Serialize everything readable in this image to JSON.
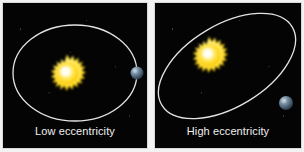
{
  "figure": {
    "background_color": "#f2f2f2",
    "panel_background": "#050505",
    "panel_border_color": "#d8d8d8",
    "caption_color": "#f0f0f0"
  },
  "panels": [
    {
      "id": "low-eccentricity",
      "caption": "Low eccentricity",
      "orbit": {
        "shape": "ellipse",
        "stroke_color": "#efefef",
        "center_x": 72,
        "center_y": 70,
        "radius_x": 62,
        "radius_y": 48,
        "rotation_deg": 0,
        "stroke_width": 1.3
      },
      "sun": {
        "label": "sun-icon",
        "center_x": 64,
        "center_y": 70,
        "core_color": "#fffde8",
        "mid_color": "#ffe23a",
        "edge_color": "#f0c010",
        "radius": 17,
        "spike_count": 22
      },
      "planet": {
        "label": "planet-icon",
        "center_x": 134,
        "center_y": 70,
        "radius": 6.5,
        "light_color": "#9fb4c6",
        "dark_color": "#2b3d52"
      }
    },
    {
      "id": "high-eccentricity",
      "caption": "High eccentricity",
      "orbit": {
        "shape": "ellipse",
        "stroke_color": "#efefef",
        "center_x": 72,
        "center_y": 63,
        "radius_x": 76,
        "radius_y": 41,
        "rotation_deg": -31,
        "stroke_width": 1.3
      },
      "sun": {
        "label": "sun-icon",
        "center_x": 54,
        "center_y": 52,
        "core_color": "#fffde8",
        "mid_color": "#ffe23a",
        "edge_color": "#f0c010",
        "radius": 17,
        "spike_count": 22
      },
      "planet": {
        "label": "planet-icon",
        "center_x": 131,
        "center_y": 100,
        "radius": 7,
        "light_color": "#9fb4c6",
        "dark_color": "#2b3d52"
      }
    }
  ]
}
